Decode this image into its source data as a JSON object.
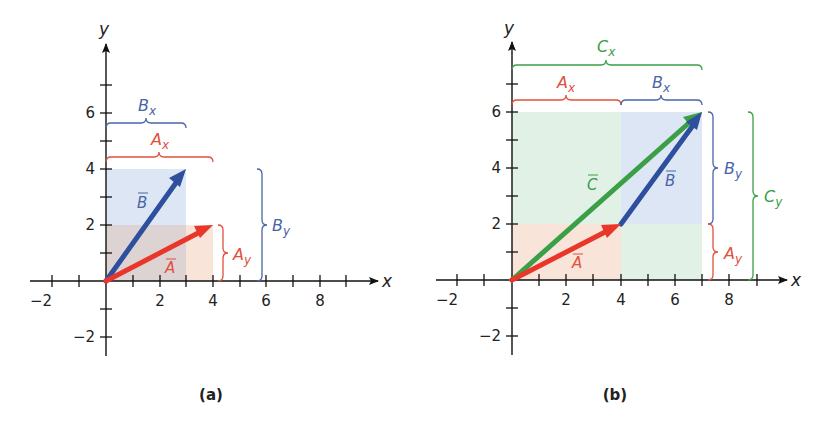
{
  "figure": {
    "panels": [
      {
        "id": "a",
        "label": "(a)",
        "axes": {
          "x_label": "x",
          "y_label": "y",
          "x_ticks": [
            "−2",
            "2",
            "4",
            "6",
            "8"
          ],
          "y_ticks": [
            "6",
            "4",
            "2",
            "−2"
          ]
        },
        "vectors": [
          {
            "name": "A",
            "label": "A",
            "from": [
              0,
              0
            ],
            "to": [
              4,
              2
            ],
            "color": "#e8372a"
          },
          {
            "name": "B",
            "label": "B",
            "from": [
              0,
              0
            ],
            "to": [
              3,
              4
            ],
            "color": "#2d4f9e"
          }
        ],
        "components": [
          {
            "label": "B",
            "sub": "x",
            "color": "#4a64a8"
          },
          {
            "label": "A",
            "sub": "x",
            "color": "#e0503c"
          },
          {
            "label": "A",
            "sub": "y",
            "color": "#e0503c"
          },
          {
            "label": "B",
            "sub": "y",
            "color": "#4a64a8"
          }
        ]
      },
      {
        "id": "b",
        "label": "(b)",
        "axes": {
          "x_label": "x",
          "y_label": "y",
          "x_ticks": [
            "−2",
            "2",
            "4",
            "6",
            "8"
          ],
          "y_ticks": [
            "6",
            "4",
            "2",
            "−2"
          ]
        },
        "vectors": [
          {
            "name": "A",
            "label": "A",
            "from": [
              0,
              0
            ],
            "to": [
              4,
              2
            ],
            "color": "#e8372a"
          },
          {
            "name": "B",
            "label": "B",
            "from": [
              4,
              2
            ],
            "to": [
              7,
              6
            ],
            "color": "#2d4f9e"
          },
          {
            "name": "C",
            "label": "C",
            "from": [
              0,
              0
            ],
            "to": [
              7,
              6
            ],
            "color": "#3a9f46"
          }
        ],
        "components": [
          {
            "label": "C",
            "sub": "x",
            "color": "#3a9f46"
          },
          {
            "label": "A",
            "sub": "x",
            "color": "#e0503c"
          },
          {
            "label": "B",
            "sub": "x",
            "color": "#4a64a8"
          },
          {
            "label": "B",
            "sub": "y",
            "color": "#4a64a8"
          },
          {
            "label": "A",
            "sub": "y",
            "color": "#e0503c"
          },
          {
            "label": "C",
            "sub": "y",
            "color": "#3a9f46"
          }
        ]
      }
    ]
  }
}
